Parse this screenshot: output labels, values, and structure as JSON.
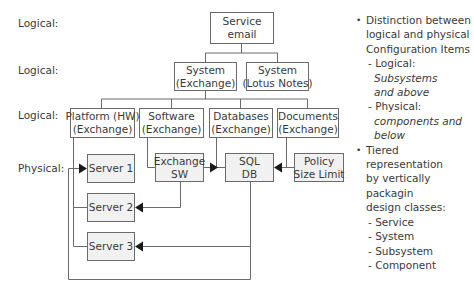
{
  "tier_labels": [
    "Logical:",
    "Logical:",
    "Logical:",
    "Physical:"
  ],
  "nodes": {
    "service": [
      "Service",
      "email"
    ],
    "system_exchange": [
      "System",
      "(Exchange)"
    ],
    "system_lotus": [
      "System",
      "(Lotus Notes)"
    ],
    "platform": [
      "Platform (HW)",
      "(Exchange)"
    ],
    "software": [
      "Software",
      "(Exchange)"
    ],
    "databases": [
      "Databases",
      "(Exchange)"
    ],
    "documents": [
      "Documents",
      "(Exchange)"
    ],
    "server1": [
      "Server 1"
    ],
    "server2": [
      "Server 2"
    ],
    "server3": [
      "Server 3"
    ],
    "exchange_sw": [
      "Exchange",
      "SW"
    ],
    "sql_db": [
      "SQL",
      "DB"
    ],
    "policy": [
      "Policy",
      "Size Limit"
    ]
  },
  "notes": {
    "bullet1": [
      "Distinction between",
      "logical and physical",
      "Configuration Items"
    ],
    "sub_logical_prefix": "- Logical: ",
    "sub_logical_italic": "Subsystems",
    "sub_logical_italic2": "and above",
    "sub_physical_prefix": "- Physical:",
    "sub_physical_italic": "components and",
    "sub_physical_italic2": "below",
    "bullet2": [
      "Tiered representation",
      "by vertically packagin",
      "design classes:"
    ],
    "classes": [
      "- Service",
      "- System",
      "- Subsystem",
      "- Component"
    ]
  },
  "colors": {
    "line": "#6a6a6a",
    "arrow": "#1a1a1a",
    "physical_fill": "#f1f1f1",
    "text": "#3a3a3a"
  }
}
